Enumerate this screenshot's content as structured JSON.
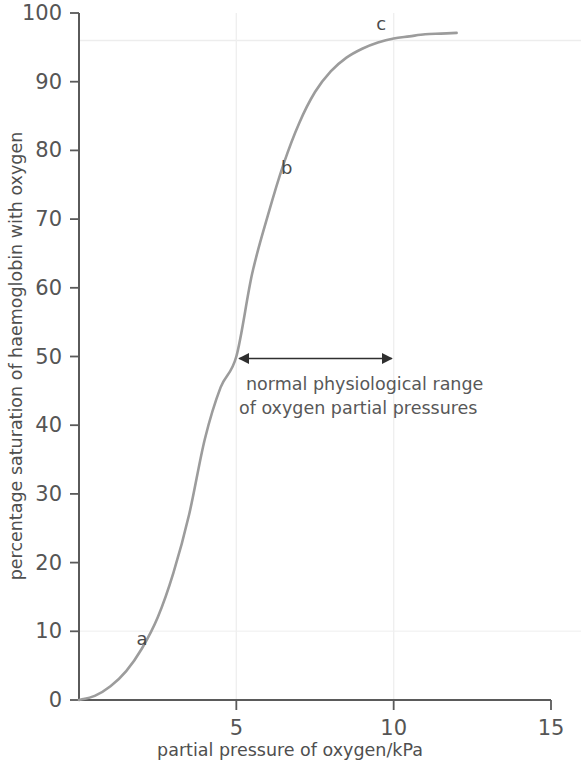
{
  "chart_data": {
    "type": "line",
    "title": "",
    "xlabel": "partial pressure of oxygen/kPa",
    "ylabel": "percentage saturation of haemoglobin with oxygen",
    "xlim": [
      0,
      15
    ],
    "ylim": [
      0,
      100
    ],
    "xticks": [
      "0",
      "5",
      "10",
      "15"
    ],
    "xtick_values": [
      0,
      5,
      10,
      15
    ],
    "yticks": [
      "0",
      "10",
      "20",
      "30",
      "40",
      "50",
      "60",
      "70",
      "80",
      "90",
      "100"
    ],
    "ytick_values": [
      0,
      10,
      20,
      30,
      40,
      50,
      60,
      70,
      80,
      90,
      100
    ],
    "grid": "faint",
    "legend": "none",
    "series": [
      {
        "name": "oxyhaemoglobin dissociation curve",
        "color": "#9c9c9c",
        "x": [
          0.0,
          0.5,
          1.0,
          1.5,
          2.0,
          2.5,
          3.0,
          3.5,
          4.0,
          4.5,
          5.0,
          5.5,
          6.0,
          6.5,
          7.0,
          7.5,
          8.0,
          8.5,
          9.0,
          9.5,
          10.0,
          10.5,
          11.0,
          11.5,
          12.0
        ],
        "values": [
          0,
          0.6,
          2.0,
          4.2,
          7.5,
          12.0,
          18.5,
          27.0,
          38.0,
          45.5,
          50.0,
          62.0,
          70.5,
          78.0,
          84.0,
          88.5,
          91.5,
          93.5,
          94.8,
          95.7,
          96.3,
          96.6,
          96.9,
          97.0,
          97.1
        ]
      }
    ],
    "point_labels": [
      {
        "label": "a",
        "x": 2.0,
        "y": 8.0
      },
      {
        "label": "b",
        "x": 6.6,
        "y": 76.5
      },
      {
        "label": "c",
        "x": 9.6,
        "y": 97.5
      }
    ],
    "annotations": [
      {
        "name": "physiological-range",
        "line1": "normal physiological range",
        "line2": "of oxygen partial pressures",
        "arrow_from_x": 5,
        "arrow_to_x": 10,
        "arrow_y": 50
      }
    ],
    "gridlines": {
      "horizontal_values": [
        10,
        96
      ],
      "vertical_values": [
        5,
        10
      ]
    }
  },
  "colors": {
    "curve": "#9c9c9c",
    "axis": "#5a5a5a",
    "text": "#4f4f4f",
    "gridline": "#ededed",
    "arrow": "#2f2f2f",
    "background": "#ffffff"
  }
}
